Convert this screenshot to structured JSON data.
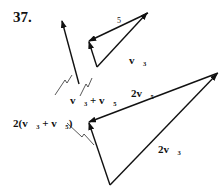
{
  "problem_number": "37.",
  "labels": {
    "side_5": "5",
    "v3": "v⃗₃",
    "v3_plus_v5": "v⃗₃ + v⃗₅",
    "two_v3_plus_v5": "2(v⃗₃ + v⃗₅)",
    "two_v5": "2v⃗₅",
    "two_v3": "2v⃗₃"
  },
  "colors": {
    "stroke": "#111111",
    "background": "#ffffff"
  }
}
